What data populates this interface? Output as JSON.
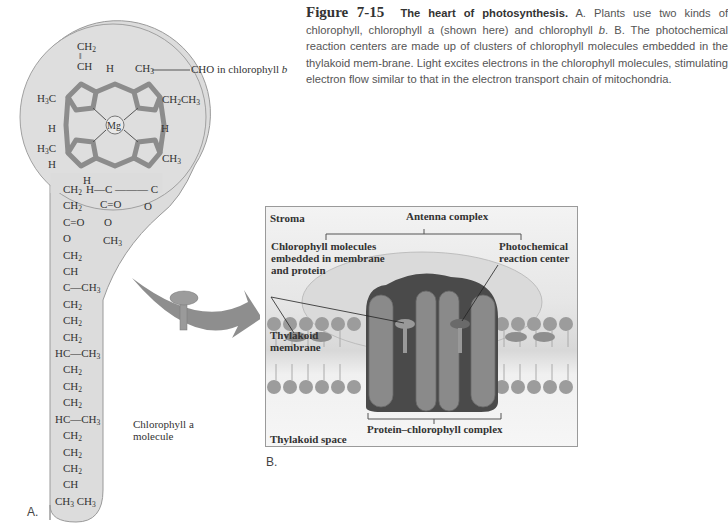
{
  "figure": {
    "number": "Figure 7-15",
    "title": "The heart of photosynthesis.",
    "caption_parts": [
      " A. Plants use two kinds of chlorophyll, chlorophyll a (shown here) and chlorophyll ",
      "b",
      ". B. The photochemical reaction centers are made up of clusters of chlorophyll molecules embedded in the thylakoid mem-brane. Light excites electrons in the chlorophyll molecules, stimulating electron flow similar to that in the electron transport chain of mitochondria."
    ]
  },
  "panel_a": {
    "letter": "A.",
    "annotation": "CHO in chlorophyll b",
    "molecule_label_line1": "Chlorophyll a",
    "molecule_label_line2": "molecule",
    "center_atom": "Mg",
    "ring_substituents": [
      "CH2",
      "CH",
      "H",
      "CH3",
      "H3C",
      "CH2CH3",
      "H",
      "H",
      "H3C",
      "H",
      "CH3",
      "H"
    ],
    "tail_chain": [
      "CH2",
      "CH2",
      "C=O",
      "O",
      "CH2",
      "CH",
      "C—CH3",
      "CH2",
      "CH2",
      "CH2",
      "HC—CH3",
      "CH2",
      "CH2",
      "CH2",
      "HC—CH3",
      "CH2",
      "CH2",
      "CH2",
      "CH",
      "CH3 CH3"
    ],
    "side_chain": [
      "H—C",
      "C",
      "C=O",
      "O",
      "CH3",
      "O"
    ]
  },
  "panel_b": {
    "letter": "B.",
    "stroma": "Stroma",
    "antenna_complex": "Antenna complex",
    "chlorophyll_label": [
      "Chlorophyll molecules",
      "embedded in membrane",
      "and protein"
    ],
    "reaction_center_label": [
      "Photochemical",
      "reaction center"
    ],
    "thylakoid_membrane": [
      "Thylakoid",
      "membrane"
    ],
    "protein_complex": "Protein–chlorophyll complex",
    "thylakoid_space": "Thylakoid space"
  },
  "colors": {
    "ring": "#8c8c8c",
    "molecule_bg": "#d9d9d9",
    "protein_dark": "#4a4a4a",
    "protein_light": "#8a8a8a",
    "lipid_head": "#9c9c9c"
  }
}
